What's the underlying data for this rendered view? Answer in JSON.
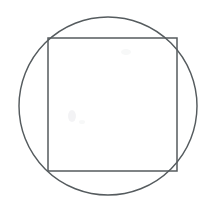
{
  "figure": {
    "title": "Square inscribed in a circle",
    "background_color": "#ffffff",
    "stroke_color": "#555b5e",
    "canvas": {
      "width": 212,
      "height": 213
    },
    "shapes": [
      {
        "name": "circle",
        "type": "circle",
        "label": "Circle",
        "center_x": 108,
        "center_y": 106,
        "radius": 89,
        "stroke_width": 1.45,
        "fill": "none"
      },
      {
        "name": "square",
        "type": "rect",
        "label": "Square",
        "x": 48,
        "y": 38,
        "width": 129,
        "height": 133,
        "stroke_width": 1.5,
        "fill": "none"
      }
    ],
    "artifacts": [
      {
        "name": "scan-speck-left",
        "cx": 72,
        "cy": 116,
        "rx": 4,
        "ry": 6
      },
      {
        "name": "scan-speck-upper",
        "cx": 126,
        "cy": 52,
        "rx": 5,
        "ry": 3
      },
      {
        "name": "scan-speck-mid",
        "cx": 82,
        "cy": 122,
        "rx": 3,
        "ry": 2
      }
    ]
  }
}
